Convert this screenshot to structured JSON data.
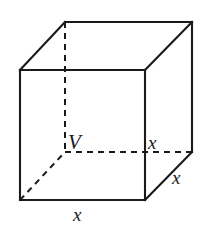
{
  "figure": {
    "name": "cube-oblique-projection",
    "background_color": "#ffffff",
    "line_color": "#1a1a1a",
    "labels": {
      "vertex": "V",
      "edge_depth_right": "x",
      "edge_vertical_right": "x",
      "edge_bottom_front": "x"
    },
    "geometry": {
      "front_face": {
        "top_left": [
          20,
          70
        ],
        "top_right": [
          145,
          70
        ],
        "bottom_right": [
          145,
          200
        ],
        "bottom_left": [
          20,
          200
        ]
      },
      "back_face": {
        "top_left": [
          65,
          22
        ],
        "top_right": [
          192,
          22
        ],
        "bottom_right": [
          192,
          152
        ],
        "bottom_left": [
          65,
          152
        ]
      },
      "hidden_vertex": [
        65,
        152
      ],
      "hidden_edges": [
        [
          [
            65,
            22
          ],
          [
            65,
            152
          ]
        ],
        [
          [
            65,
            152
          ],
          [
            192,
            152
          ]
        ],
        [
          [
            65,
            152
          ],
          [
            20,
            200
          ]
        ]
      ]
    }
  }
}
